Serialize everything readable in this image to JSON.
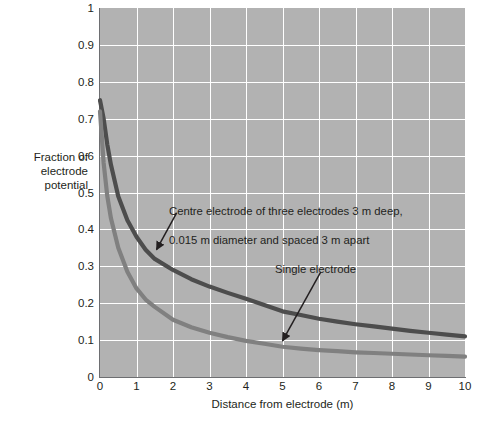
{
  "chart_data": {
    "type": "line",
    "title": "",
    "xlabel": "Distance from electrode (m)",
    "ylabel": "Fraction of electrode potential",
    "xlim": [
      0,
      10
    ],
    "ylim": [
      0,
      1
    ],
    "grid": true,
    "legend_position": "none",
    "xticks": [
      "0",
      "1",
      "2",
      "3",
      "4",
      "5",
      "6",
      "7",
      "8",
      "9",
      "10"
    ],
    "yticks": [
      "0",
      "0.1",
      "0.2",
      "0.3",
      "0.4",
      "0.5",
      "0.6",
      "0.7",
      "0.8",
      "0.9",
      "1"
    ],
    "x": [
      0,
      0.1,
      0.2,
      0.3,
      0.5,
      0.75,
      1,
      1.25,
      1.5,
      2,
      2.5,
      3,
      3.5,
      4,
      4.5,
      5,
      5.5,
      6,
      6.5,
      7,
      7.5,
      8,
      8.5,
      9,
      9.5,
      10
    ],
    "series": [
      {
        "name": "Centre electrode of three electrodes 3 m deep, 0.015 m diameter and spaced 3 m apart",
        "color": "#4d4d4d",
        "values": [
          0.75,
          0.7,
          0.63,
          0.575,
          0.49,
          0.425,
          0.38,
          0.345,
          0.32,
          0.29,
          0.265,
          0.245,
          0.228,
          0.212,
          0.195,
          0.178,
          0.168,
          0.158,
          0.15,
          0.143,
          0.137,
          0.131,
          0.125,
          0.12,
          0.115,
          0.11
        ]
      },
      {
        "name": "Single electrode",
        "color": "#808080",
        "values": [
          0.72,
          0.58,
          0.49,
          0.43,
          0.35,
          0.285,
          0.24,
          0.21,
          0.19,
          0.155,
          0.135,
          0.12,
          0.108,
          0.098,
          0.09,
          0.082,
          0.077,
          0.073,
          0.07,
          0.067,
          0.065,
          0.063,
          0.061,
          0.059,
          0.057,
          0.055
        ]
      }
    ],
    "annotations": [
      {
        "id": "centre-electrode",
        "text": "Centre electrode of three electrodes 3 m deep,\n0.015 m diameter and spaced 3 m apart",
        "arrow_from": [
          2.1,
          0.445
        ],
        "arrow_to": [
          1.55,
          0.345
        ]
      },
      {
        "id": "single-electrode",
        "text": "Single electrode",
        "arrow_from": [
          6.05,
          0.285
        ],
        "arrow_to": [
          5.0,
          0.098
        ]
      }
    ],
    "colors": {
      "plot_background": "#b2b2b2",
      "gridline": "#ffffff",
      "axis": "#6d6e71",
      "text": "#231f20",
      "series_dark": "#4d4d4d",
      "series_light": "#808080"
    }
  },
  "axes": {
    "x_title": "Distance from electrode (m)",
    "y_title_lines": [
      "Fraction of",
      "electrode",
      "potential"
    ],
    "x_ticks": [
      {
        "label": "0"
      },
      {
        "label": "1"
      },
      {
        "label": "2"
      },
      {
        "label": "3"
      },
      {
        "label": "4"
      },
      {
        "label": "5"
      },
      {
        "label": "6"
      },
      {
        "label": "7"
      },
      {
        "label": "8"
      },
      {
        "label": "9"
      },
      {
        "label": "10"
      }
    ],
    "y_ticks": [
      {
        "label": "1"
      },
      {
        "label": "0.9"
      },
      {
        "label": "0.8"
      },
      {
        "label": "0.7"
      },
      {
        "label": "0.6"
      },
      {
        "label": "0.5"
      },
      {
        "label": "0.4"
      },
      {
        "label": "0.3"
      },
      {
        "label": "0.2"
      },
      {
        "label": "0.1"
      },
      {
        "label": "0"
      }
    ]
  },
  "annotations": {
    "centre_line1": "Centre electrode of three electrodes 3 m deep,",
    "centre_line2": "0.015 m diameter and spaced 3 m apart",
    "single": "Single electrode"
  }
}
